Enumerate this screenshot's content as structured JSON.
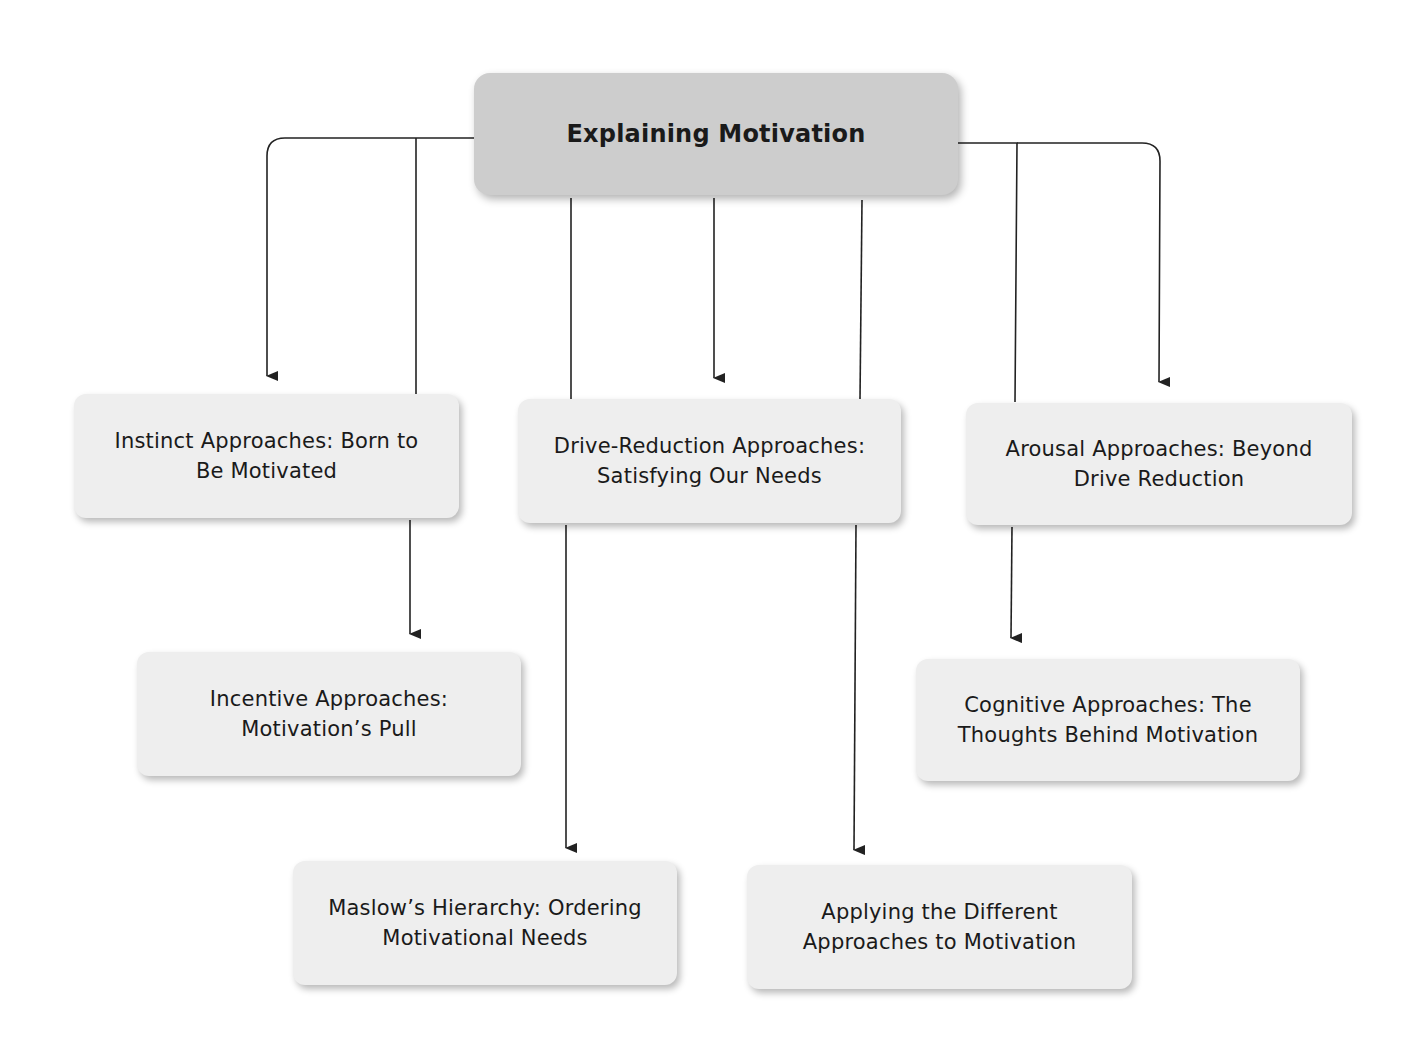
{
  "diagram": {
    "title": "Explaining Motivation",
    "nodes": {
      "instinct": "Instinct Approaches: Born to\nBe Motivated",
      "drive": "Drive-Reduction Approaches:\nSatisfying Our Needs",
      "arousal": "Arousal Approaches: Beyond\nDrive Reduction",
      "incentive": "Incentive Approaches:\nMotivation’s Pull",
      "cognitive": "Cognitive Approaches: The\nThoughts Behind Motivation",
      "maslow": "Maslow’s Hierarchy: Ordering\nMotivational Needs",
      "applying": "Applying the Different\nApproaches to Motivation"
    },
    "edges": [
      {
        "from": "Explaining Motivation",
        "to": "Instinct Approaches: Born to Be Motivated"
      },
      {
        "from": "Explaining Motivation",
        "to": "Incentive Approaches: Motivation’s Pull"
      },
      {
        "from": "Explaining Motivation",
        "to": "Maslow’s Hierarchy: Ordering Motivational Needs"
      },
      {
        "from": "Explaining Motivation",
        "to": "Drive-Reduction Approaches: Satisfying Our Needs"
      },
      {
        "from": "Explaining Motivation",
        "to": "Applying the Different Approaches to Motivation"
      },
      {
        "from": "Explaining Motivation",
        "to": "Cognitive Approaches: The Thoughts Behind Motivation"
      },
      {
        "from": "Explaining Motivation",
        "to": "Arousal Approaches: Beyond Drive Reduction"
      }
    ],
    "colors": {
      "root_fill": "#cdcdcd",
      "node_fill": "#eeeeee",
      "line": "#222222"
    }
  }
}
